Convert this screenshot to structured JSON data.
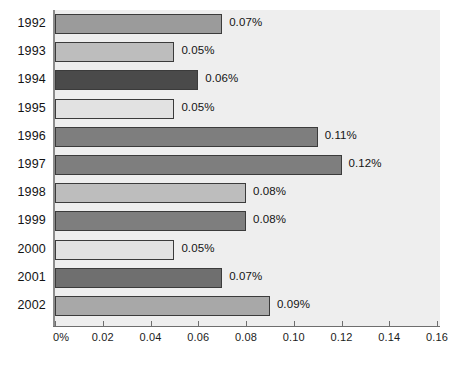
{
  "chart_data": {
    "type": "bar",
    "orientation": "horizontal",
    "title": "",
    "subtitle": "",
    "xlabel": "",
    "ylabel": "",
    "categories": [
      "1992",
      "1993",
      "1994",
      "1995",
      "1996",
      "1997",
      "1998",
      "1999",
      "2000",
      "2001",
      "2002"
    ],
    "values": [
      0.07,
      0.05,
      0.06,
      0.05,
      0.11,
      0.12,
      0.08,
      0.08,
      0.05,
      0.07,
      0.09
    ],
    "value_labels": [
      "0.07%",
      "0.05%",
      "0.06%",
      "0.05%",
      "0.11%",
      "0.12%",
      "0.08%",
      "0.08%",
      "0.05%",
      "0.07%",
      "0.09%"
    ],
    "bar_colors": [
      "#9b9b9b",
      "#bdbdbd",
      "#4a4a4a",
      "#e2e2e2",
      "#7e7e7e",
      "#7e7e7e",
      "#bdbdbd",
      "#7e7e7e",
      "#e2e2e2",
      "#6f6f6f",
      "#a8a8a8"
    ],
    "xlim": [
      0,
      0.16
    ],
    "xticks": [
      0,
      0.02,
      0.04,
      0.06,
      0.08,
      0.1,
      0.12,
      0.14,
      0.16
    ],
    "xtick_labels": [
      "0%",
      "0.02",
      "0.04",
      "0.06",
      "0.08",
      "0.10",
      "0.12",
      "0.14",
      "0.16"
    ],
    "grid": false,
    "legend": null,
    "plot_background_color": "#eeeeee",
    "axis_color": "#6e6e6e",
    "bar_border_color": "#3b3b3b"
  }
}
